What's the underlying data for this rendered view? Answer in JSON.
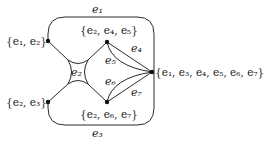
{
  "diagram": {
    "type": "hypergraph",
    "colors": {
      "stroke": "#2a2a2a",
      "vertex": "#111111",
      "text": "#1a1a1a",
      "background": "#ffffff"
    },
    "vertices": [
      {
        "id": "v1",
        "label": "{e1, e2}",
        "x": 48,
        "y": 41
      },
      {
        "id": "v2",
        "label": "{e2, e4, e5}",
        "x": 107,
        "y": 42
      },
      {
        "id": "v3",
        "label": "{e1, e3, e4, e5, e6, e7}",
        "x": 152,
        "y": 72
      },
      {
        "id": "v4",
        "label": "{e2, e3}",
        "x": 48,
        "y": 102
      },
      {
        "id": "v5",
        "label": "{e2, e6, e7}",
        "x": 107,
        "y": 102
      }
    ],
    "edges": [
      {
        "id": "e1",
        "label": "e1",
        "connects": [
          "v1",
          "v3"
        ]
      },
      {
        "id": "e2",
        "label": "e2",
        "connects": [
          "v1",
          "v2",
          "v4",
          "v5"
        ]
      },
      {
        "id": "e3",
        "label": "e3",
        "connects": [
          "v4",
          "v3"
        ]
      },
      {
        "id": "e4",
        "label": "e4",
        "connects": [
          "v2",
          "v3"
        ]
      },
      {
        "id": "e5",
        "label": "e5",
        "connects": [
          "v2",
          "v3"
        ]
      },
      {
        "id": "e6",
        "label": "e6",
        "connects": [
          "v5",
          "v3"
        ]
      },
      {
        "id": "e7",
        "label": "e7",
        "connects": [
          "v5",
          "v3"
        ]
      }
    ],
    "vertex_labels": {
      "v1": {
        "open": "{",
        "items": [
          "e",
          "1",
          ", ",
          "e",
          "2"
        ],
        "close": "}"
      },
      "text": {
        "v1": "{e₁, e₂}",
        "v2": "{e₂, e₄, e₅}",
        "v3": "{e₁, e₃, e₄, e₅, e₆, e₇}",
        "v4": "{e₂, e₃}",
        "v5": "{e₂, e₆, e₇}"
      }
    },
    "edge_labels": {
      "e1": "e₁",
      "e2": "e₂",
      "e3": "e₃",
      "e4": "e₄",
      "e5": "e₅",
      "e6": "e₆",
      "e7": "e₇"
    }
  }
}
